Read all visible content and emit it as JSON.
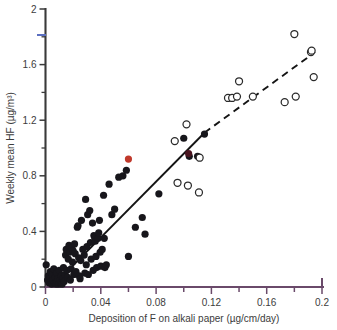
{
  "chart_data": {
    "type": "scatter",
    "title": "",
    "xlabel": "Deposition of F on alkali paper (µg/cm/day)",
    "ylabel": "Weekly mean HF (µg/m³)",
    "xlim": [
      0,
      0.2
    ],
    "ylim": [
      0,
      2
    ],
    "xticks": [
      0,
      0.04,
      0.08,
      0.12,
      0.16,
      0.2
    ],
    "xticklabels": [
      "0",
      "0.04",
      "0.08",
      "0.12",
      "0.16",
      "0.2"
    ],
    "yticks": [
      0,
      0.4,
      0.8,
      1.2,
      1.6,
      2
    ],
    "yticklabels": [
      "0",
      "0.4",
      "0.8",
      "1.2",
      "1.6",
      "2"
    ],
    "x_minor_ticks": [
      0.02,
      0.06,
      0.1,
      0.14,
      0.18
    ],
    "y_minor_ticks": [
      0.2,
      0.6,
      1.0,
      1.4,
      1.8
    ],
    "grid": false,
    "legend_position": "none",
    "series": [
      {
        "name": "filled-circles",
        "marker": "filled-circle",
        "color": "#17161b",
        "points": [
          [
            0.0005,
            0.16
          ],
          [
            0.0015,
            0.05
          ],
          [
            0.002,
            0.08
          ],
          [
            0.0025,
            0.03
          ],
          [
            0.003,
            0.06
          ],
          [
            0.0035,
            0.11
          ],
          [
            0.004,
            0.04
          ],
          [
            0.0045,
            0.02
          ],
          [
            0.005,
            0.09
          ],
          [
            0.0055,
            0.05
          ],
          [
            0.006,
            0.13
          ],
          [
            0.0065,
            0.03
          ],
          [
            0.007,
            0.07
          ],
          [
            0.0075,
            0.02
          ],
          [
            0.008,
            0.1
          ],
          [
            0.0085,
            0.04
          ],
          [
            0.009,
            0.06
          ],
          [
            0.0095,
            0.02
          ],
          [
            0.01,
            0.12
          ],
          [
            0.0105,
            0.05
          ],
          [
            0.011,
            0.03
          ],
          [
            0.0115,
            0.08
          ],
          [
            0.012,
            0.02
          ],
          [
            0.0125,
            0.06
          ],
          [
            0.013,
            0.14
          ],
          [
            0.0135,
            0.04
          ],
          [
            0.014,
            0.09
          ],
          [
            0.0145,
            0.23
          ],
          [
            0.015,
            0.27
          ],
          [
            0.0155,
            0.12
          ],
          [
            0.016,
            0.07
          ],
          [
            0.0165,
            0.2
          ],
          [
            0.017,
            0.3
          ],
          [
            0.0175,
            0.25
          ],
          [
            0.018,
            0.05
          ],
          [
            0.0185,
            0.13
          ],
          [
            0.019,
            0.28
          ],
          [
            0.0195,
            0.18
          ],
          [
            0.02,
            0.26
          ],
          [
            0.0205,
            0.09
          ],
          [
            0.021,
            0.31
          ],
          [
            0.0215,
            0.24
          ],
          [
            0.022,
            0.11
          ],
          [
            0.023,
            0.43
          ],
          [
            0.0235,
            0.44
          ],
          [
            0.024,
            0.21
          ],
          [
            0.0245,
            0.08
          ],
          [
            0.025,
            0.06
          ],
          [
            0.0255,
            0.19
          ],
          [
            0.026,
            0.48
          ],
          [
            0.027,
            0.27
          ],
          [
            0.028,
            0.23
          ],
          [
            0.0285,
            0.1
          ],
          [
            0.029,
            0.63
          ],
          [
            0.0295,
            0.16
          ],
          [
            0.03,
            0.29
          ],
          [
            0.0305,
            0.52
          ],
          [
            0.031,
            0.09
          ],
          [
            0.032,
            0.55
          ],
          [
            0.0325,
            0.32
          ],
          [
            0.033,
            0.2
          ],
          [
            0.034,
            0.46
          ],
          [
            0.0345,
            0.12
          ],
          [
            0.035,
            0.37
          ],
          [
            0.0355,
            0.36
          ],
          [
            0.036,
            0.33
          ],
          [
            0.0365,
            0.22
          ],
          [
            0.037,
            0.14
          ],
          [
            0.038,
            0.35
          ],
          [
            0.0385,
            0.39
          ],
          [
            0.039,
            0.48
          ],
          [
            0.0395,
            0.25
          ],
          [
            0.04,
            0.15
          ],
          [
            0.041,
            0.27
          ],
          [
            0.042,
            0.66
          ],
          [
            0.0425,
            0.35
          ],
          [
            0.043,
            0.14
          ],
          [
            0.044,
            0.16
          ],
          [
            0.046,
            0.74
          ],
          [
            0.048,
            0.52
          ],
          [
            0.05,
            0.56
          ],
          [
            0.053,
            0.79
          ],
          [
            0.056,
            0.8
          ],
          [
            0.0585,
            0.84
          ],
          [
            0.06,
            0.22
          ],
          [
            0.065,
            0.43
          ],
          [
            0.07,
            0.5
          ],
          [
            0.072,
            0.38
          ],
          [
            0.082,
            0.67
          ],
          [
            0.1,
            1.07
          ],
          [
            0.104,
            0.94
          ],
          [
            0.11,
            0.94
          ],
          [
            0.115,
            1.1
          ]
        ]
      },
      {
        "name": "open-circles",
        "marker": "open-circle",
        "color": "#ffffff",
        "points": [
          [
            0.0935,
            1.05
          ],
          [
            0.0955,
            0.75
          ],
          [
            0.102,
            1.17
          ],
          [
            0.103,
            0.73
          ],
          [
            0.111,
            0.68
          ],
          [
            0.1115,
            0.93
          ],
          [
            0.132,
            1.36
          ],
          [
            0.135,
            1.36
          ],
          [
            0.1385,
            1.37
          ],
          [
            0.14,
            1.48
          ],
          [
            0.15,
            1.37
          ],
          [
            0.173,
            1.33
          ],
          [
            0.18,
            1.82
          ],
          [
            0.181,
            1.37
          ],
          [
            0.192,
            1.69
          ],
          [
            0.1925,
            1.7
          ],
          [
            0.194,
            1.51
          ]
        ]
      },
      {
        "name": "highlight-red",
        "marker": "filled-circle",
        "color": "#c0392b",
        "points": [
          [
            0.06,
            0.92
          ]
        ]
      },
      {
        "name": "highlight-maroon",
        "marker": "filled-circle",
        "color": "#4a1520",
        "points": [
          [
            0.1035,
            0.96
          ]
        ]
      }
    ],
    "fit_line": {
      "name": "regression-line",
      "solid_segment": [
        [
          0.0175,
          0.13
        ],
        [
          0.115,
          1.11
        ]
      ],
      "dashed_segment": [
        [
          0.115,
          1.11
        ],
        [
          0.195,
          1.69
        ]
      ],
      "style": "solid-then-dashed"
    },
    "annotations": []
  }
}
